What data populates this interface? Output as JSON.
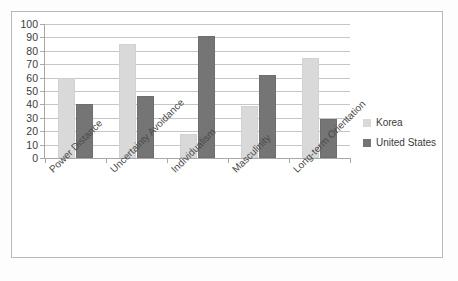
{
  "chart_data": {
    "type": "bar",
    "title": "",
    "subtitle": "",
    "xlabel": "",
    "ylabel": "",
    "ylim": [
      0,
      100
    ],
    "y_ticks": [
      100,
      90,
      80,
      70,
      60,
      50,
      40,
      30,
      20,
      10,
      0
    ],
    "grid": true,
    "legend_position": "right",
    "categories": [
      "Power Distance",
      "Uncertainty Avoidance",
      "Individualism",
      "Masculinity",
      "Long-term Orientation"
    ],
    "series": [
      {
        "name": "Korea",
        "color": "#d9d9d9",
        "values": [
          60,
          85,
          18,
          39,
          75
        ]
      },
      {
        "name": "United States",
        "color": "#757575",
        "values": [
          40,
          46,
          91,
          62,
          29
        ]
      }
    ]
  },
  "legend": {
    "items": [
      {
        "label": "Korea",
        "swatch": "korea"
      },
      {
        "label": "United States",
        "swatch": "us"
      }
    ]
  },
  "colors": {
    "korea": "#d9d9d9",
    "united_states": "#757575",
    "gridline": "#c6c6c6",
    "axis": "#a8a8a8",
    "frame": "#b9b9b9",
    "text": "#3b3b3b"
  }
}
